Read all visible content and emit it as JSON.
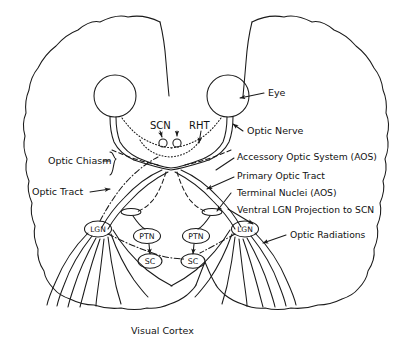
{
  "figure": {
    "domain": "diagram",
    "caption": "Visual Cortex",
    "background_color": "#ffffff",
    "ink_color": "#1a1a1a"
  },
  "labels": {
    "eye": "Eye",
    "optic_nerve": "Optic Nerve",
    "optic_chiasm": "Optic Chiasm",
    "optic_tract": "Optic Tract",
    "accessory_optic_system": "Accessory Optic System (AOS)",
    "primary_optic_tract": "Primary Optic Tract",
    "terminal_nuclei": "Terminal Nuclei (AOS)",
    "ventral_lgn_projection": "Ventral LGN Projection to SCN",
    "optic_radiations": "Optic Radiations",
    "visual_cortex": "Visual Cortex",
    "scn": "SCN",
    "rht": "RHT"
  },
  "nuclei": [
    {
      "id": "lgn-left",
      "text": "LGN"
    },
    {
      "id": "lgn-right",
      "text": "LGN"
    },
    {
      "id": "ptn-left",
      "text": "PTN"
    },
    {
      "id": "ptn-right",
      "text": "PTN"
    },
    {
      "id": "sc-left",
      "text": "SC"
    },
    {
      "id": "sc-right",
      "text": "SC"
    }
  ],
  "structures": {
    "eyes": [
      "left-eye",
      "right-eye"
    ],
    "scn_nuclei_count": 2,
    "terminal_nuclei_count": 2,
    "optic_radiation_fibers_per_side": 6
  },
  "line_styles": {
    "primary_optic_tract": "solid",
    "accessory_optic_system": "dashed",
    "retinohypothalamic_tract": "dotted",
    "ventral_lgn_to_scn": "dash-dot"
  }
}
